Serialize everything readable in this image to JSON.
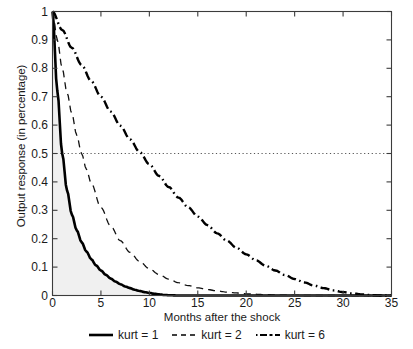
{
  "chart_data": {
    "type": "line",
    "title": "",
    "xlabel": "Months after the shock",
    "ylabel": "Output response (in percentage)",
    "xlim": [
      0,
      35
    ],
    "ylim": [
      0,
      1
    ],
    "xticks": [
      0,
      5,
      10,
      15,
      20,
      25,
      30,
      35
    ],
    "yticks": [
      0,
      0.1,
      0.2,
      0.3,
      0.4,
      0.5,
      0.6,
      0.7,
      0.8,
      0.9,
      1
    ],
    "ytick_labels": [
      "0",
      "0.1",
      "0.2",
      "0.3",
      "0.4",
      "0.5",
      "0.6",
      "0.7",
      "0.8",
      "0.9",
      "1"
    ],
    "xtick_labels": [
      "0",
      "5",
      "10",
      "15",
      "20",
      "25",
      "30",
      "35"
    ],
    "grid": false,
    "legend_position": "below",
    "reference_lines": [
      {
        "name": "half-response",
        "axis": "y",
        "value": 0.5,
        "style": "dotted",
        "color": "#555555"
      }
    ],
    "shaded_area": {
      "name": "area-under-kurt1",
      "series": "kurt = 1",
      "color": "#f0f0f0"
    },
    "series": [
      {
        "name": "kurt = 1",
        "style": "solid",
        "color": "#000000",
        "width": 2.6,
        "half_life_months": 1.0,
        "x": [
          0,
          0.5,
          1,
          1.5,
          2,
          2.5,
          3,
          3.5,
          4,
          4.5,
          5,
          5.5,
          6,
          6.5,
          7,
          7.5,
          8,
          8.5,
          9,
          9.5,
          10,
          10.5,
          11,
          11.5,
          12,
          13,
          14,
          16,
          18,
          20,
          25,
          30,
          35
        ],
        "y": [
          1.0,
          0.72,
          0.5,
          0.37,
          0.285,
          0.23,
          0.188,
          0.155,
          0.128,
          0.106,
          0.088,
          0.073,
          0.06,
          0.049,
          0.04,
          0.032,
          0.026,
          0.02,
          0.016,
          0.012,
          0.009,
          0.006,
          0.004,
          0.002,
          0.001,
          0.0,
          0.0,
          0.0,
          0.0,
          0.0,
          0.0,
          0.0,
          0.0
        ]
      },
      {
        "name": "kurt = 2",
        "style": "dashed",
        "color": "#111111",
        "width": 1.3,
        "half_life_months": 2.8,
        "x": [
          0,
          0.5,
          1,
          1.5,
          2,
          2.5,
          3,
          3.5,
          4,
          5,
          6,
          7,
          8,
          9,
          10,
          11,
          12,
          13,
          14,
          15,
          16,
          17,
          18,
          19,
          20,
          22,
          24,
          26,
          30,
          35
        ],
        "y": [
          1.0,
          0.9,
          0.8,
          0.715,
          0.64,
          0.565,
          0.5,
          0.445,
          0.395,
          0.31,
          0.245,
          0.193,
          0.152,
          0.12,
          0.094,
          0.074,
          0.058,
          0.045,
          0.035,
          0.027,
          0.021,
          0.016,
          0.012,
          0.009,
          0.006,
          0.003,
          0.001,
          0.0,
          0.0,
          0.0
        ]
      },
      {
        "name": "kurt = 6",
        "style": "dashdot",
        "color": "#000000",
        "width": 2.4,
        "half_life_months": 7.5,
        "x": [
          0,
          1,
          2,
          3,
          4,
          5,
          6,
          7,
          8,
          9,
          10,
          11,
          12,
          13,
          14,
          15,
          16,
          17,
          18,
          19,
          20,
          21,
          22,
          23,
          24,
          25,
          26,
          27,
          28,
          29,
          30,
          31,
          32,
          33,
          34,
          35
        ],
        "y": [
          1.0,
          0.935,
          0.872,
          0.812,
          0.755,
          0.7,
          0.648,
          0.598,
          0.55,
          0.505,
          0.462,
          0.421,
          0.382,
          0.345,
          0.311,
          0.278,
          0.248,
          0.219,
          0.193,
          0.168,
          0.145,
          0.124,
          0.105,
          0.088,
          0.072,
          0.058,
          0.046,
          0.035,
          0.026,
          0.018,
          0.012,
          0.007,
          0.004,
          0.001,
          0.0,
          0.0
        ]
      }
    ]
  },
  "axes": {
    "xlabel": "Months after the shock",
    "ylabel": "Output response (in percentage)"
  },
  "legend": {
    "items": [
      {
        "label": "kurt = 1",
        "style": "solid"
      },
      {
        "label": "kurt = 2",
        "style": "dashed"
      },
      {
        "label": "kurt = 6",
        "style": "dashdot"
      }
    ]
  },
  "colors": {
    "axis": "#3c3c3c",
    "curve": "#000000",
    "shade": "#f0f0f0",
    "reference": "#555555",
    "background": "#ffffff"
  }
}
